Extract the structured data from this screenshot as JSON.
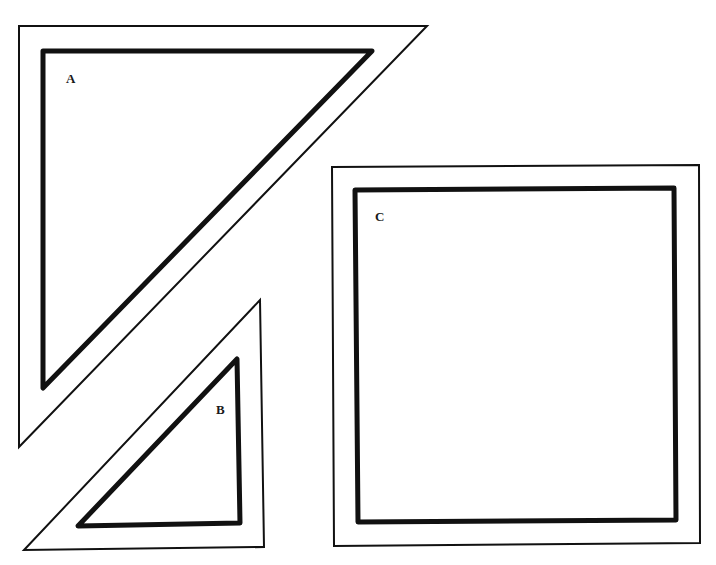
{
  "diagram": {
    "colors": {
      "stroke": "#111111",
      "background": "#ffffff"
    },
    "shapes": [
      {
        "id": "A",
        "label": "A",
        "type": "right-triangle",
        "outer": "19,26 427,26 19,447",
        "inner": "43,51 372,51 43,388",
        "label_pos": [
          66,
          83
        ]
      },
      {
        "id": "B",
        "label": "B",
        "type": "right-triangle",
        "outer": "260,300 264,547 24,550",
        "inner": "237,359 240,523 78,526",
        "label_pos": [
          216,
          414
        ]
      },
      {
        "id": "C",
        "label": "C",
        "type": "square",
        "outer": "332,167 699,165 700,543 334,546",
        "inner": "355,190 674,188 676,520 358,522",
        "label_pos": [
          375,
          221
        ]
      }
    ]
  }
}
